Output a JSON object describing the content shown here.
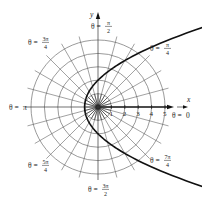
{
  "figure": {
    "grid": {
      "circle_radii": [
        1,
        2,
        3,
        4,
        5
      ],
      "radial_line_step_deg": 15,
      "grid_color": "#555555",
      "curve_color": "#111111"
    },
    "polar_axis": {
      "tick_labels": [
        "1",
        "2",
        "3",
        "4",
        "5"
      ],
      "x_label": "x",
      "y_label": "y"
    },
    "angle_labels": [
      {
        "id": "theta-0",
        "prefix": "θ = ",
        "num": "0",
        "den": ""
      },
      {
        "id": "theta-pi-over-4",
        "prefix": "θ = ",
        "num": "π",
        "den": "4"
      },
      {
        "id": "theta-pi-over-2",
        "prefix": "θ = ",
        "num": "π",
        "den": "2"
      },
      {
        "id": "theta-3pi-over-4",
        "prefix": "θ = ",
        "num": "3π",
        "den": "4"
      },
      {
        "id": "theta-pi",
        "prefix": "θ = ",
        "num": "π",
        "den": ""
      },
      {
        "id": "theta-5pi-over-4",
        "prefix": "θ = ",
        "num": "5π",
        "den": "4"
      },
      {
        "id": "theta-3pi-over-2",
        "prefix": "θ = ",
        "num": "3π",
        "den": "2"
      },
      {
        "id": "theta-7pi-over-4",
        "prefix": "θ = ",
        "num": "7π",
        "den": "4"
      }
    ],
    "curve": {
      "equation": "r = 2/(1 - cos θ)",
      "vertex": [
        -1,
        0
      ]
    }
  }
}
